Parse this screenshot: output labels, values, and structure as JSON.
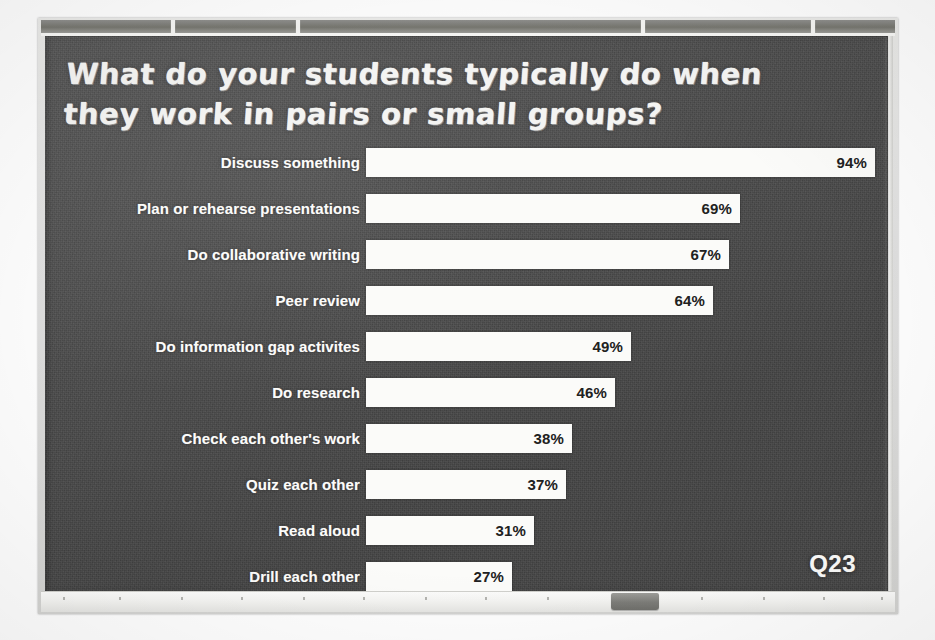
{
  "slide": {
    "title_line1": "What do your students typically do when",
    "title_line2": "they work in pairs or small groups?",
    "question_tag": "Q23",
    "board_color": "#4b4b4b",
    "bar_color": "#fbfbf9",
    "label_color": "#fcfcfa",
    "value_text_color": "#212121",
    "frame_color": "#dedede"
  },
  "chart_data": {
    "type": "bar",
    "orientation": "horizontal",
    "title": "What do your students typically do when they work in pairs or small groups?",
    "xlabel": "",
    "ylabel": "",
    "xlim": [
      0,
      100
    ],
    "grid": false,
    "legend": null,
    "value_suffix": "%",
    "categories": [
      "Discuss something",
      "Plan or rehearse presentations",
      "Do collaborative writing",
      "Peer review",
      "Do information gap activites",
      "Do research",
      "Check each other's work",
      "Quiz each other",
      "Read aloud",
      "Drill each other"
    ],
    "values": [
      94,
      69,
      67,
      64,
      49,
      46,
      38,
      37,
      31,
      27
    ],
    "labels": [
      "94%",
      "69%",
      "67%",
      "64%",
      "49%",
      "46%",
      "38%",
      "37%",
      "31%",
      "27%"
    ]
  },
  "hardware": {
    "rail_ticks": [
      130,
      255,
      600,
      770
    ],
    "tray_ticks": [
      22,
      78,
      140,
      200,
      262,
      322,
      384,
      444,
      506,
      660,
      722,
      782,
      840
    ],
    "eraser_label": "board-eraser"
  }
}
